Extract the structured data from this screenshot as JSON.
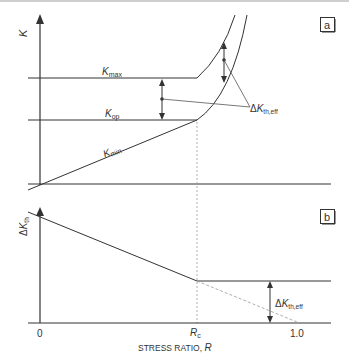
{
  "panel_a": {
    "badge": "a",
    "y_axis_label": "K",
    "curves": {
      "kmax": {
        "base": "K",
        "sub": "max"
      },
      "kop": {
        "base": "K",
        "sub": "op"
      },
      "kmin": {
        "base": "K",
        "sub": "min"
      }
    },
    "annotation": {
      "prefix": "Δ",
      "base": "K",
      "sub": "th,eff"
    }
  },
  "panel_b": {
    "badge": "b",
    "y_axis_label": {
      "prefix": "Δ",
      "base": "K",
      "sub": "th"
    },
    "annotation": {
      "prefix": "Δ",
      "base": "K",
      "sub": "th,eff"
    },
    "x_ticks": {
      "zero": "0",
      "rc": {
        "base": "R",
        "sub": "c"
      },
      "one": "1.0"
    },
    "x_axis_label": {
      "text": "STRESS RATIO, ",
      "var": "R"
    }
  },
  "colors": {
    "line": "#333333",
    "dotted": "#9a9a9a",
    "badge_border": "#333333"
  }
}
